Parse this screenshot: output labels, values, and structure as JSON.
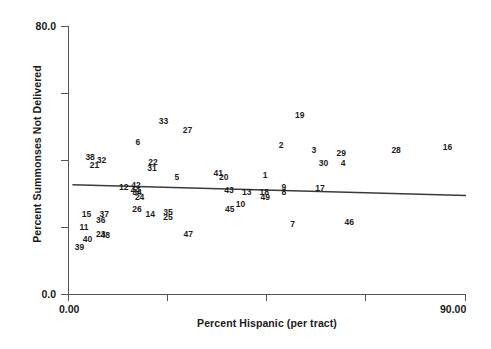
{
  "chart_data": {
    "type": "scatter",
    "title": "",
    "xlabel": "Percent Hispanic (per tract)",
    "ylabel": "Percent Summonses Not Delivered",
    "xlim": [
      0.0,
      90.0
    ],
    "ylim": [
      0.0,
      80.0
    ],
    "xtick_labels": [
      "0.00",
      "",
      "",
      "",
      "90.00"
    ],
    "xtick_values": [
      0.0,
      22.5,
      45.0,
      67.5,
      90.0
    ],
    "ytick_labels": [
      "0.0",
      "",
      "",
      "",
      "80.0"
    ],
    "ytick_values": [
      0.0,
      20.0,
      40.0,
      60.0,
      80.0
    ],
    "grid": false,
    "legend": "none",
    "point_marker": "case-number-label",
    "points": [
      {
        "label": "16",
        "x": 85.8,
        "y": 44.0
      },
      {
        "label": "19",
        "x": 52.4,
        "y": 53.5
      },
      {
        "label": "33",
        "x": 21.6,
        "y": 51.5
      },
      {
        "label": "27",
        "x": 27.0,
        "y": 49.0
      },
      {
        "label": "28",
        "x": 74.2,
        "y": 43.0
      },
      {
        "label": "2",
        "x": 48.2,
        "y": 44.5
      },
      {
        "label": "3",
        "x": 55.6,
        "y": 43.0
      },
      {
        "label": "29",
        "x": 61.8,
        "y": 42.0
      },
      {
        "label": "6",
        "x": 15.8,
        "y": 45.5
      },
      {
        "label": "38",
        "x": 5.0,
        "y": 41.0
      },
      {
        "label": "32",
        "x": 7.6,
        "y": 40.0
      },
      {
        "label": "21",
        "x": 6.0,
        "y": 38.5
      },
      {
        "label": "22",
        "x": 19.2,
        "y": 39.5
      },
      {
        "label": "31",
        "x": 19.0,
        "y": 37.5
      },
      {
        "label": "30",
        "x": 57.8,
        "y": 39.0
      },
      {
        "label": "4",
        "x": 62.2,
        "y": 39.0
      },
      {
        "label": "41",
        "x": 34.0,
        "y": 36.0
      },
      {
        "label": "20",
        "x": 35.2,
        "y": 35.0
      },
      {
        "label": "5",
        "x": 24.6,
        "y": 35.0
      },
      {
        "label": "1",
        "x": 44.6,
        "y": 35.5
      },
      {
        "label": "17",
        "x": 57.0,
        "y": 31.5
      },
      {
        "label": "12",
        "x": 12.6,
        "y": 32.0
      },
      {
        "label": "42",
        "x": 15.4,
        "y": 32.5
      },
      {
        "label": "44",
        "x": 15.2,
        "y": 31.0
      },
      {
        "label": "34",
        "x": 15.6,
        "y": 30.5
      },
      {
        "label": "24",
        "x": 16.2,
        "y": 29.0
      },
      {
        "label": "43",
        "x": 36.4,
        "y": 31.0
      },
      {
        "label": "13",
        "x": 40.4,
        "y": 30.5
      },
      {
        "label": "18",
        "x": 44.4,
        "y": 30.5
      },
      {
        "label": "49",
        "x": 44.6,
        "y": 29.0
      },
      {
        "label": "9",
        "x": 48.8,
        "y": 32.0
      },
      {
        "label": "8",
        "x": 48.8,
        "y": 30.5
      },
      {
        "label": "10",
        "x": 39.0,
        "y": 27.0
      },
      {
        "label": "45",
        "x": 36.6,
        "y": 25.5
      },
      {
        "label": "26",
        "x": 15.6,
        "y": 25.5
      },
      {
        "label": "14",
        "x": 18.6,
        "y": 24.0
      },
      {
        "label": "35",
        "x": 22.6,
        "y": 24.5
      },
      {
        "label": "25",
        "x": 22.6,
        "y": 23.0
      },
      {
        "label": "15",
        "x": 4.2,
        "y": 24.0
      },
      {
        "label": "37",
        "x": 8.2,
        "y": 24.0
      },
      {
        "label": "36",
        "x": 7.4,
        "y": 22.0
      },
      {
        "label": "7",
        "x": 50.8,
        "y": 21.0
      },
      {
        "label": "46",
        "x": 63.6,
        "y": 21.5
      },
      {
        "label": "11",
        "x": 3.6,
        "y": 20.0
      },
      {
        "label": "23",
        "x": 7.4,
        "y": 18.0
      },
      {
        "label": "48",
        "x": 8.4,
        "y": 17.5
      },
      {
        "label": "47",
        "x": 27.2,
        "y": 18.0
      },
      {
        "label": "40",
        "x": 4.4,
        "y": 16.5
      },
      {
        "label": "39",
        "x": 2.6,
        "y": 14.0
      }
    ],
    "fit_line": {
      "type": "linear-regression",
      "x_start": 1.0,
      "y_start": 32.6,
      "x_end": 90.0,
      "y_end": 29.4
    }
  }
}
